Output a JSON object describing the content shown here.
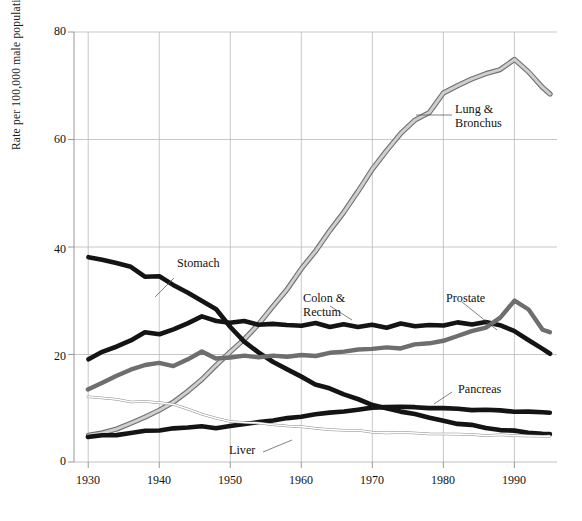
{
  "chart_data": {
    "type": "line",
    "title": "",
    "subtitle": "",
    "xlabel": "",
    "ylabel": "Rate per 100,000 male population",
    "xlim": [
      1928,
      1996
    ],
    "ylim": [
      0,
      80
    ],
    "grid": true,
    "legend_position": "inline-annotations",
    "xticks": [
      "1930",
      "1940",
      "1950",
      "1960",
      "1970",
      "1980",
      "1990"
    ],
    "xtick_values": [
      1930,
      1940,
      1950,
      1960,
      1970,
      1980,
      1990
    ],
    "yticks": [
      "0",
      "20",
      "40",
      "60",
      "80"
    ],
    "ytick_values": [
      0,
      20,
      40,
      60,
      80
    ],
    "x": [
      1930,
      1932,
      1934,
      1936,
      1938,
      1940,
      1942,
      1944,
      1946,
      1948,
      1950,
      1952,
      1954,
      1956,
      1958,
      1960,
      1962,
      1964,
      1966,
      1968,
      1970,
      1972,
      1974,
      1976,
      1978,
      1980,
      1982,
      1984,
      1986,
      1988,
      1990,
      1992,
      1994,
      1995
    ],
    "series": [
      {
        "name": "Lung & Bronchus",
        "color": "#9a9a9a",
        "style": "light-gray-band",
        "values": [
          4.9,
          5.4,
          6.2,
          7.2,
          8.3,
          9.6,
          11.2,
          13.1,
          15.4,
          18.0,
          20.5,
          23.0,
          25.6,
          28.8,
          32.1,
          36.0,
          39.4,
          43.0,
          46.6,
          50.3,
          54.5,
          57.8,
          61.2,
          63.6,
          65.1,
          68.5,
          69.9,
          71.3,
          72.2,
          73.0,
          74.8,
          72.5,
          69.8,
          68.4
        ]
      },
      {
        "name": "Stomach",
        "color": "#141414",
        "style": "thick-black",
        "values": [
          38.2,
          37.6,
          37.0,
          36.2,
          34.4,
          34.6,
          33.0,
          31.6,
          30.0,
          28.4,
          25.0,
          22.4,
          20.4,
          18.6,
          17.2,
          15.8,
          14.5,
          13.6,
          12.6,
          11.6,
          10.7,
          10.0,
          9.4,
          8.8,
          8.2,
          7.6,
          7.2,
          6.8,
          6.4,
          6.0,
          5.8,
          5.5,
          5.3,
          5.2
        ]
      },
      {
        "name": "Colon & Rectum",
        "color": "#141414",
        "style": "thick-black",
        "values": [
          19.1,
          20.4,
          21.6,
          22.7,
          24.2,
          23.8,
          24.6,
          25.8,
          27.1,
          26.2,
          25.9,
          26.3,
          25.5,
          25.8,
          25.6,
          25.4,
          25.8,
          25.2,
          25.6,
          25.2,
          25.6,
          25.0,
          25.7,
          25.3,
          25.6,
          25.4,
          25.9,
          25.5,
          26.0,
          25.4,
          24.5,
          22.8,
          21.0,
          20.2
        ]
      },
      {
        "name": "Prostate",
        "color": "#6e6e6e",
        "style": "medium-gray",
        "values": [
          13.4,
          14.8,
          16.1,
          17.2,
          18.0,
          18.4,
          17.8,
          19.2,
          20.6,
          19.3,
          19.4,
          19.8,
          19.5,
          19.8,
          19.6,
          20.0,
          19.8,
          20.3,
          20.5,
          20.9,
          21.0,
          21.4,
          21.2,
          21.8,
          22.2,
          22.6,
          23.4,
          24.3,
          25.1,
          26.9,
          30.1,
          28.4,
          24.7,
          24.1
        ]
      },
      {
        "name": "Pancreas",
        "color": "#141414",
        "style": "thick-black",
        "values": [
          4.7,
          4.9,
          5.1,
          5.4,
          5.7,
          5.8,
          6.2,
          6.5,
          6.7,
          6.3,
          6.6,
          7.0,
          7.4,
          7.8,
          8.1,
          8.5,
          8.8,
          9.1,
          9.4,
          9.7,
          10.0,
          10.1,
          10.2,
          10.1,
          10.0,
          9.9,
          9.8,
          9.7,
          9.6,
          9.5,
          9.4,
          9.3,
          9.2,
          9.1
        ]
      },
      {
        "name": "Liver",
        "color": "#ffffff",
        "style": "thin-outline",
        "values": [
          12.1,
          11.9,
          11.6,
          11.2,
          11.3,
          11.0,
          10.6,
          9.8,
          9.0,
          8.2,
          7.6,
          7.4,
          7.2,
          7.0,
          6.8,
          6.5,
          6.3,
          6.1,
          5.9,
          5.8,
          5.6,
          5.5,
          5.4,
          5.3,
          5.2,
          5.2,
          5.1,
          5.1,
          5.0,
          5.0,
          4.9,
          4.9,
          4.8,
          4.8
        ]
      }
    ],
    "annotations": [
      {
        "text": "Lung &\nBronchus",
        "line1": "Lung &",
        "line2": "Bronchus",
        "x": 1974,
        "y": 63
      },
      {
        "text": "Stomach",
        "line1": "Stomach",
        "line2": "",
        "x": 1946,
        "y": 35
      },
      {
        "text": "Colon &\nRectum",
        "line1": "Colon &",
        "line2": "Rectum",
        "x": 1960,
        "y": 30
      },
      {
        "text": "Prostate",
        "line1": "Prostate",
        "line2": "",
        "x": 1982,
        "y": 29
      },
      {
        "text": "Pancreas",
        "line1": "Pancreas",
        "line2": "",
        "x": 1980,
        "y": 14
      },
      {
        "text": "Liver",
        "line1": "Liver",
        "line2": "",
        "x": 1957,
        "y": 2.5
      }
    ]
  },
  "axis": {
    "y_title": "Rate per 100,000 male population",
    "y_ticks": [
      "80",
      "60",
      "40",
      "20",
      "0"
    ],
    "x_ticks": [
      "1930",
      "1940",
      "1950",
      "1960",
      "1970",
      "1980",
      "1990"
    ]
  },
  "labels": {
    "lung_line1": "Lung &",
    "lung_line2": "Bronchus",
    "stomach": "Stomach",
    "colon_line1": "Colon &",
    "colon_line2": "Rectum",
    "prostate": "Prostate",
    "pancreas": "Pancreas",
    "liver": "Liver"
  },
  "colors": {
    "lung": "#9a9a9a",
    "stomach": "#141414",
    "colon": "#141414",
    "prostate": "#6e6e6e",
    "pancreas": "#141414",
    "liver": "#ffffff",
    "grid": "#b9b9b9",
    "axis": "#8d8d8d"
  }
}
